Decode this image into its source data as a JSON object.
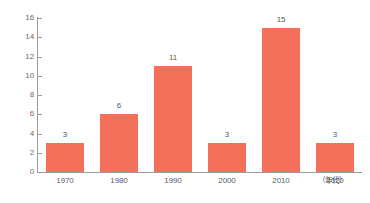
{
  "chart_data": {
    "type": "bar",
    "title": "",
    "subtitle": "",
    "xlabel": "（年代）",
    "ylabel": "",
    "categories": [
      "1970",
      "1980",
      "1990",
      "2000",
      "2010",
      "2020"
    ],
    "values": [
      3,
      6,
      11,
      3,
      15,
      3
    ],
    "series": [
      {
        "name": "",
        "values": [
          3,
          6,
          11,
          3,
          15,
          3
        ]
      }
    ],
    "value_labels": [
      "3",
      "6",
      "11",
      "3",
      "15",
      "3"
    ],
    "ylim": [
      0,
      16
    ],
    "y_ticks": [
      0,
      2,
      4,
      6,
      8,
      10,
      12,
      14,
      16
    ],
    "y_tick_labels": [
      "0",
      "2",
      "4",
      "6",
      "8",
      "10",
      "12",
      "14",
      "16"
    ],
    "grid": false,
    "legend": false,
    "legend_position": "none",
    "annotations": [
      "（年代）"
    ],
    "colors": {
      "bar": "#f5705a",
      "axis": "#9a9a9a",
      "text": "#5a5a5a",
      "background": "#ffffff"
    }
  }
}
